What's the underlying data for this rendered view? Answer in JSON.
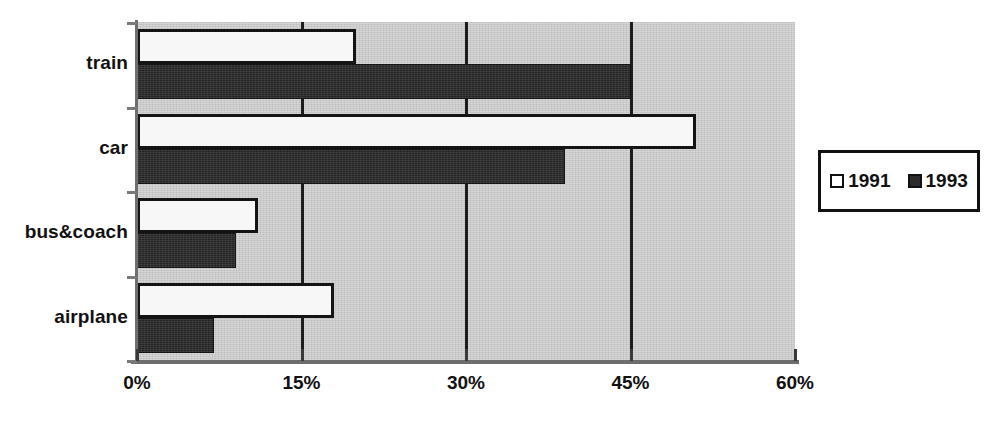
{
  "chart_data": {
    "type": "bar",
    "orientation": "horizontal",
    "title": "",
    "subtitle": "",
    "xlabel": "",
    "ylabel": "",
    "categories": [
      "train",
      "car",
      "bus&coach",
      "airplane"
    ],
    "series": [
      {
        "name": "1991",
        "values": [
          20,
          51,
          11,
          18
        ],
        "color": "#f7f7f7"
      },
      {
        "name": "1993",
        "values": [
          45,
          39,
          9,
          7
        ],
        "color": "#2b2b2b"
      }
    ],
    "xlim": [
      0,
      60
    ],
    "xticks": [
      0,
      15,
      30,
      45,
      60
    ],
    "xtick_labels": [
      "0%",
      "15%",
      "30%",
      "45%",
      "60%"
    ],
    "grid": true,
    "grid_axis": "x",
    "legend_position": "right",
    "plot_background": "#c9c9c9"
  },
  "legend": {
    "entries": [
      {
        "label": "1991",
        "swatch": "legend-swatch-1991"
      },
      {
        "label": "1993",
        "swatch": "legend-swatch-1993"
      }
    ]
  },
  "axis": {
    "x_tick_labels": [
      "0%",
      "15%",
      "30%",
      "45%",
      "60%"
    ],
    "y_category_labels": [
      "train",
      "car",
      "bus&coach",
      "airplane"
    ]
  }
}
